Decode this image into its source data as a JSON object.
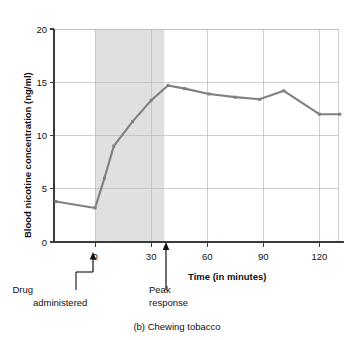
{
  "chart_data": {
    "type": "line",
    "title": "",
    "caption": "(b) Chewing tobacco",
    "xlabel": "Time (in minutes)",
    "ylabel": "Blood nicotine concentration (ng/ml)",
    "xlim": [
      -22,
      130
    ],
    "ylim": [
      0,
      20
    ],
    "xticks": [
      0,
      30,
      60,
      90,
      120
    ],
    "xtick_labels": [
      "0",
      "30",
      "60",
      "90",
      "120"
    ],
    "yticks": [
      0,
      5,
      10,
      15,
      20
    ],
    "ytick_labels": [
      "0",
      "5",
      "10",
      "15",
      "20"
    ],
    "grid": true,
    "legend": "none",
    "line_color": "#808080",
    "grid_color": "#b9b9b9",
    "axis_color": "#3a3a3a",
    "shaded_band": {
      "label": "chewing period",
      "x_start": 0,
      "x_end": 37,
      "color": "#e0e0e0"
    },
    "series": [
      {
        "name": "Blood nicotine concentration",
        "x": [
          -21,
          0,
          5,
          10,
          20,
          30,
          39,
          48,
          61,
          75,
          88,
          101,
          120,
          131
        ],
        "values": [
          3.8,
          3.2,
          6.0,
          9.0,
          11.3,
          13.3,
          14.7,
          14.4,
          13.9,
          13.6,
          13.4,
          14.2,
          12.0,
          12.0
        ]
      }
    ],
    "annotations": [
      {
        "name": "drug-administered",
        "line1": "Drug",
        "line2": "administered",
        "x": 0,
        "arrow": "up"
      },
      {
        "name": "peak-response",
        "line1": "Peak",
        "line2": "response",
        "x": 39,
        "arrow": "up"
      }
    ]
  }
}
